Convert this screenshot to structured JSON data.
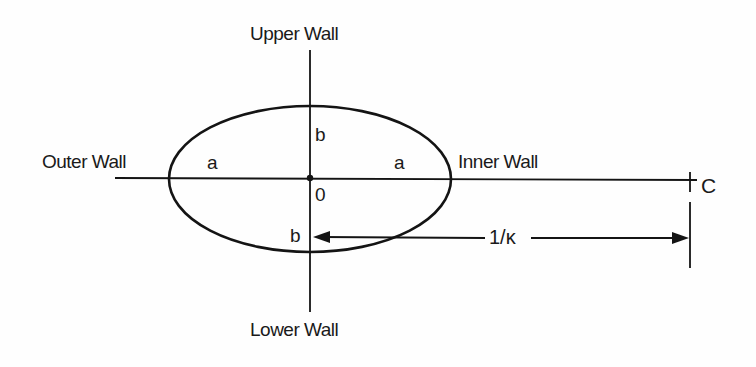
{
  "diagram": {
    "title": "",
    "labels": {
      "upper_wall": "Upper Wall",
      "lower_wall": "Lower Wall",
      "outer_wall": "Outer Wall",
      "inner_wall": "Inner Wall",
      "semi_axis_a_left": "a",
      "semi_axis_a_right": "a",
      "semi_axis_b_upper": "b",
      "semi_axis_b_lower": "b",
      "origin": "0",
      "center_of_curvature": "C",
      "radius_of_curvature": "1/κ"
    },
    "shapes": {
      "ellipse": {
        "cx": 310,
        "cy": 178,
        "rx": 141,
        "ry": 73
      },
      "horizontal_axis": {
        "x1": 115,
        "x2": 697,
        "y": 179
      },
      "vertical_axis": {
        "x": 310,
        "y1": 50,
        "y2": 312
      },
      "dimension_line": {
        "x1": 313,
        "x2": 690,
        "y": 238
      },
      "c_tick": {
        "x": 690,
        "y1": 172,
        "y2": 192
      },
      "c_extension_line": {
        "x": 690,
        "y1": 202,
        "y2": 268
      }
    },
    "colors": {
      "line": "#141414",
      "text": "#1a1a1a",
      "background": "#ffffff"
    }
  }
}
